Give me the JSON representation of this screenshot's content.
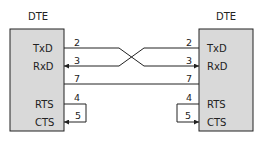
{
  "diagram": {
    "type": "null-modem-wiring",
    "colors": {
      "box_fill": "#d9d9d9",
      "stroke": "#222222",
      "background": "#ffffff"
    },
    "left_device": {
      "title": "DTE",
      "signals": {
        "txd": "TxD",
        "rxd": "RxD",
        "rts": "RTS",
        "cts": "CTS"
      },
      "pins": {
        "txd": "2",
        "rxd": "3",
        "gnd": "7",
        "rts": "4",
        "cts": "5"
      }
    },
    "right_device": {
      "title": "DTE",
      "signals": {
        "txd": "TxD",
        "rxd": "RxD",
        "rts": "RTS",
        "cts": "CTS"
      },
      "pins": {
        "txd": "2",
        "rxd": "3",
        "gnd": "7",
        "rts": "4",
        "cts": "5"
      }
    },
    "connections": [
      {
        "from": "left.TxD (2)",
        "to": "right.RxD (3)",
        "style": "crossover"
      },
      {
        "from": "right.TxD (2)",
        "to": "left.RxD (3)",
        "style": "crossover"
      },
      {
        "from": "left.7",
        "to": "right.7",
        "style": "straight"
      },
      {
        "from": "left.RTS (4)",
        "to": "left.CTS (5)",
        "style": "loopback"
      },
      {
        "from": "right.RTS (4)",
        "to": "right.CTS (5)",
        "style": "loopback"
      }
    ]
  }
}
